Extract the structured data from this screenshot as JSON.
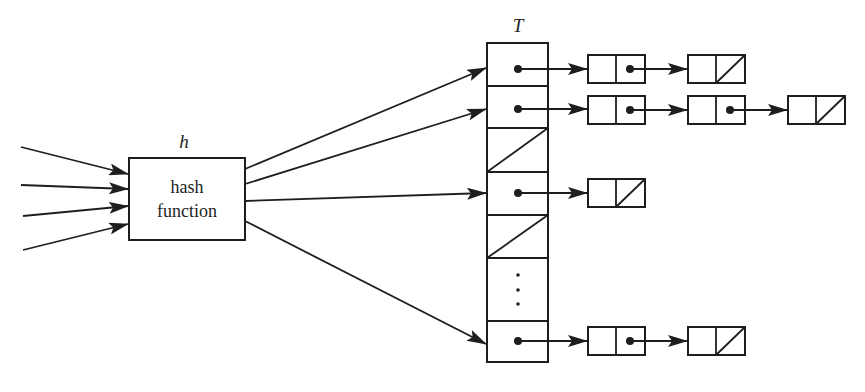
{
  "diagram": {
    "hash_function": {
      "label": "h",
      "text_line1": "hash",
      "text_line2": "function"
    },
    "table": {
      "label": "T",
      "slots": [
        {
          "index": 0,
          "state": "pointer",
          "chain_length": 2
        },
        {
          "index": 1,
          "state": "pointer",
          "chain_length": 3
        },
        {
          "index": 2,
          "state": "nil",
          "chain_length": 0
        },
        {
          "index": 3,
          "state": "pointer",
          "chain_length": 1
        },
        {
          "index": 4,
          "state": "nil",
          "chain_length": 0
        },
        {
          "index": 5,
          "state": "ellipsis",
          "glyph": "⋮"
        },
        {
          "index": 6,
          "state": "pointer",
          "chain_length": 2
        }
      ]
    },
    "input_arrows": 4,
    "hash_output_arrows": [
      {
        "target_slot": 0
      },
      {
        "target_slot": 1
      },
      {
        "target_slot": 3
      },
      {
        "target_slot": 6
      }
    ],
    "colors": {
      "stroke": "#1e1e1e",
      "background": "#ffffff"
    }
  }
}
